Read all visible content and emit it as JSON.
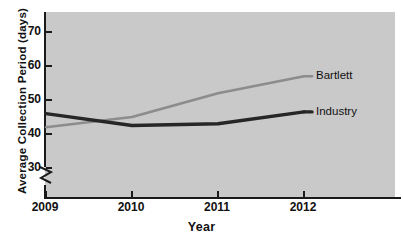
{
  "chart_data": {
    "type": "line",
    "title": "",
    "xlabel": "Year",
    "ylabel": "Average Collection Period (days)",
    "categories": [
      "2009",
      "2010",
      "2011",
      "2012"
    ],
    "x": [
      2009,
      2010,
      2011,
      2012
    ],
    "series": [
      {
        "name": "Bartlett",
        "values": [
          42,
          45,
          52,
          57
        ],
        "color": "#8c8c8c"
      },
      {
        "name": "Industry",
        "values": [
          46,
          42.5,
          43,
          46.5
        ],
        "color": "#262626"
      }
    ],
    "ylim": [
      26,
      74
    ],
    "yticks": [
      30,
      40,
      50,
      60,
      70
    ],
    "ytick_labels": [
      "30",
      "40",
      "50",
      "60",
      "70"
    ],
    "xticks": [
      2009,
      2010,
      2011,
      2012
    ],
    "xtick_labels": [
      "2009",
      "2010",
      "2011",
      "2012"
    ],
    "grid": false,
    "axis_break": true,
    "axis_break_note": "y-axis broken below 30",
    "legend": {
      "position": "right-inline",
      "entries": [
        {
          "label": "Bartlett",
          "color": "#8c8c8c"
        },
        {
          "label": "Industry",
          "color": "#262626"
        }
      ]
    },
    "plot_background": "#c9c9c9",
    "figure_background": "#ffffff",
    "axis_color": "#1a1a1a"
  },
  "axes": {
    "y_title": "Average Collection Period (days)",
    "x_title": "Year",
    "y_labels": [
      "70",
      "60",
      "50",
      "40",
      "30"
    ],
    "x_labels": [
      "2009",
      "2010",
      "2011",
      "2012"
    ]
  },
  "legend": {
    "bartlett": "Bartlett",
    "industry": "Industry"
  }
}
